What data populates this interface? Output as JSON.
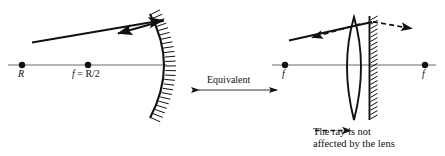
{
  "figure": {
    "colors": {
      "ink": "#111111",
      "axis": "#555555",
      "background": "#ffffff"
    }
  },
  "left_panel": {
    "name": "concave-mirror-diagram",
    "optical_axis_label": "",
    "points": [
      {
        "id": "center-of-curvature",
        "label": "R",
        "x": 22,
        "y": 65
      },
      {
        "id": "focal-point",
        "label": "f = R/2",
        "x": 88,
        "y": 65
      }
    ],
    "label_R": "R",
    "label_f_eq_R2": "f = R/2",
    "label_f_italic": "f",
    "label_equals_R2": " = R/2",
    "mirror": {
      "id": "concave-mirror",
      "type": "concave",
      "vertex_x": 166
    },
    "rays": [
      {
        "id": "incident-ray",
        "style": "solid",
        "from": [
          32,
          42
        ],
        "to": [
          166,
          20
        ]
      },
      {
        "id": "reflected-ray",
        "style": "solid",
        "from": [
          166,
          20
        ],
        "to": [
          116,
          34
        ]
      }
    ]
  },
  "middle": {
    "name": "equivalence-annotation",
    "label": "Equivalent",
    "arrow": {
      "id": "double-headed-arrow",
      "x1": 192,
      "x2": 283,
      "y": 90
    }
  },
  "right_panel": {
    "name": "lens-plus-plane-mirror-diagram",
    "points": [
      {
        "id": "focal-point-left",
        "label": "f",
        "x": 285,
        "y": 65
      },
      {
        "id": "focal-point-right",
        "label": "f",
        "x": 425,
        "y": 65
      }
    ],
    "label_f_left": "f",
    "label_f_right": "f",
    "lens": {
      "id": "converging-lens",
      "type": "biconvex",
      "center_x": 354
    },
    "mirror": {
      "id": "plane-mirror",
      "type": "plane",
      "x": 369
    },
    "rays": [
      {
        "id": "incident-ray",
        "style": "solid",
        "from": [
          289,
          40
        ],
        "to": [
          372,
          22
        ]
      },
      {
        "id": "refracted-ray-left",
        "style": "dashed",
        "from": [
          358,
          24
        ],
        "to": [
          308,
          38
        ]
      },
      {
        "id": "transmitted-ray-right",
        "style": "dashed",
        "from": [
          372,
          22
        ],
        "to": [
          414,
          29
        ]
      }
    ],
    "caption": {
      "id": "ray-note",
      "line1_prefix": "The ray ",
      "line1_suffix": " is not",
      "line2": "affected by the lens",
      "full_text": "The ray - - -➤ is not affected by the lens"
    }
  }
}
